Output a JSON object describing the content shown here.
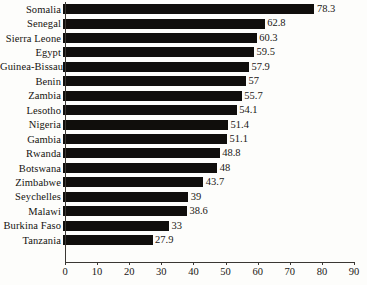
{
  "chart_data": {
    "type": "bar",
    "orientation": "horizontal",
    "title": "",
    "subtitle": "",
    "xlabel": "",
    "ylabel": "",
    "xlim": [
      0,
      90
    ],
    "xticks": [
      0,
      10,
      20,
      30,
      40,
      50,
      60,
      70,
      80,
      90
    ],
    "grid": false,
    "legend": null,
    "bar_color": "#100e0c",
    "background_color": "#fdfdfb",
    "categories": [
      "Somalia",
      "Senegal",
      "Sierra Leone",
      "Egypt",
      "Guinea-Bissau",
      "Benin",
      "Zambia",
      "Lesotho",
      "Nigeria",
      "Gambia",
      "Rwanda",
      "Botswana",
      "Zimbabwe",
      "Seychelles",
      "Malawi",
      "Burkina Faso",
      "Tanzania"
    ],
    "values": [
      78.3,
      62.8,
      60.3,
      59.5,
      57.9,
      57,
      55.7,
      54.1,
      51.4,
      51.1,
      48.8,
      48,
      43.7,
      39,
      38.6,
      33,
      27.9
    ],
    "value_labels": [
      "78.3",
      "62.8",
      "60.3",
      "59.5",
      "57.9",
      "57",
      "55.7",
      "54.1",
      "51.4",
      "51.1",
      "48.8",
      "48",
      "43.7",
      "39",
      "38.6",
      "33",
      "27.9"
    ],
    "tick_labels": [
      "0",
      "10",
      "20",
      "30",
      "40",
      "50",
      "60",
      "70",
      "80",
      "90"
    ]
  }
}
